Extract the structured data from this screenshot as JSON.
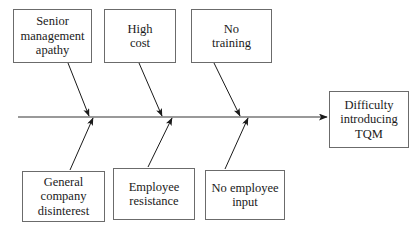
{
  "diagram": {
    "type": "fishbone-cause-and-effect",
    "spine": {
      "y": 117,
      "x_start": 18,
      "x_end": 327,
      "arrow_direction": "right",
      "color": "#777777"
    },
    "colors": {
      "box_border": "#6b6b6b",
      "line": "#777777",
      "arrow": "#1a1a1a",
      "text": "#1a1a1a",
      "background": "#ffffff"
    },
    "effect": {
      "label": "Difficulty\nintroducing\nTQM",
      "x": 329,
      "y": 91,
      "width": 80,
      "height": 57
    },
    "causes_top": [
      {
        "label": "Senior\nmanagement\napathy",
        "x": 13,
        "y": 9,
        "width": 79,
        "height": 54,
        "bone_from_x": 68,
        "bone_from_y": 63,
        "bone_to_x": 89,
        "bone_to_y": 116
      },
      {
        "label": "High\ncost",
        "x": 104,
        "y": 9,
        "width": 72,
        "height": 54,
        "bone_from_x": 139,
        "bone_from_y": 63,
        "bone_to_x": 162,
        "bone_to_y": 116
      },
      {
        "label": "No\ntraining",
        "x": 191,
        "y": 9,
        "width": 81,
        "height": 54,
        "bone_from_x": 214,
        "bone_from_y": 63,
        "bone_to_x": 240,
        "bone_to_y": 116
      }
    ],
    "causes_bottom": [
      {
        "label": "General\ncompany\ndisinterest",
        "x": 22,
        "y": 171,
        "width": 83,
        "height": 51,
        "bone_from_x": 70,
        "bone_from_y": 170,
        "bone_to_x": 93,
        "bone_to_y": 118
      },
      {
        "label": "Employee\nresistance",
        "x": 113,
        "y": 168,
        "width": 82,
        "height": 52,
        "bone_from_x": 148,
        "bone_from_y": 167,
        "bone_to_x": 172,
        "bone_to_y": 118
      },
      {
        "label": "No employee\ninput",
        "x": 205,
        "y": 170,
        "width": 80,
        "height": 50,
        "bone_from_x": 225,
        "bone_from_y": 169,
        "bone_to_x": 248,
        "bone_to_y": 118
      }
    ]
  }
}
